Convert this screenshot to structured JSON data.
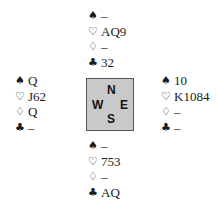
{
  "diagram": {
    "type": "bridge-deal",
    "suit_symbols": {
      "spades": "♠",
      "hearts": "♡",
      "diamonds": "♢",
      "clubs": "♣"
    },
    "compass": {
      "north": "N",
      "west": "W",
      "east": "E",
      "south": "S",
      "background_color": "#c9c9c9"
    },
    "hands": {
      "north": {
        "spades": "–",
        "hearts": "AQ9",
        "diamonds": "–",
        "clubs": "32"
      },
      "west": {
        "spades": "Q",
        "hearts": "J62",
        "diamonds": "Q",
        "clubs": "–"
      },
      "east": {
        "spades": "10",
        "hearts": "K1084",
        "diamonds": "–",
        "clubs": "–"
      },
      "south": {
        "spades": "–",
        "hearts": "753",
        "diamonds": "–",
        "clubs": "AQ"
      }
    }
  }
}
